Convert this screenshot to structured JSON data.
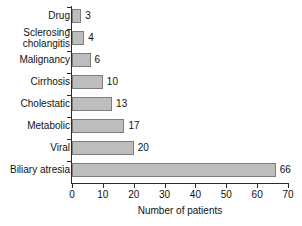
{
  "chart_data": {
    "type": "bar",
    "orientation": "horizontal",
    "title": "",
    "xlabel": "Number of patients",
    "ylabel": "",
    "categories": [
      "Drug",
      "Sclerosing cholangitis",
      "Malignancy",
      "Cirrhosis",
      "Cholestatic",
      "Metabolic",
      "Viral",
      "Biliary atresia"
    ],
    "values": [
      3,
      4,
      6,
      10,
      13,
      17,
      20,
      66
    ],
    "value_labels": [
      "3",
      "4",
      "6",
      "10",
      "13",
      "17",
      "20",
      "66"
    ],
    "xlim": [
      0,
      70
    ],
    "xticks": [
      0,
      10,
      20,
      30,
      40,
      50,
      60,
      70
    ],
    "xtick_labels": [
      "0",
      "10",
      "20",
      "30",
      "40",
      "50",
      "60",
      "70"
    ],
    "grid": false,
    "legend": false,
    "bar_fill_color": "#bdbdbd",
    "bar_border_color": "#7d7d7d",
    "axis_color": "#2b2b2b",
    "background_color": "#ffffff"
  }
}
